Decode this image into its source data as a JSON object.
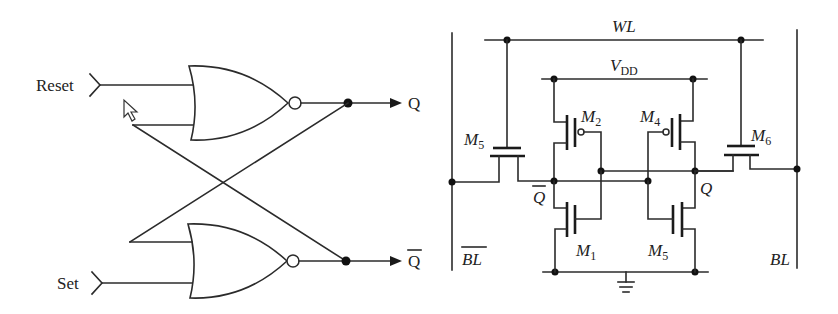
{
  "sr_latch": {
    "inputs": {
      "reset_label": "Reset",
      "set_label": "Set"
    },
    "outputs": {
      "q_label": "Q",
      "q_bar_label": "Q"
    },
    "gates": [
      {
        "type": "NOR",
        "position": "upper",
        "inputs": [
          "Reset",
          "Q-bar feedback"
        ],
        "output": "Q"
      },
      {
        "type": "NOR",
        "position": "lower",
        "inputs": [
          "Q feedback",
          "Set"
        ],
        "output": "Q-bar"
      }
    ],
    "cursor": "mouse-pointer-icon"
  },
  "sram_cell": {
    "word_line": {
      "label": "WL"
    },
    "supply": {
      "label": "V",
      "subscript": "DD"
    },
    "bit_line": {
      "label": "BL"
    },
    "bit_line_bar": {
      "label": "BL"
    },
    "nodes": {
      "q": "Q",
      "q_bar": "Q"
    },
    "transistors": [
      {
        "name": "M",
        "subscript": "5",
        "role": "access",
        "side": "left"
      },
      {
        "name": "M",
        "subscript": "2",
        "role": "pull-up PMOS",
        "side": "left"
      },
      {
        "name": "M",
        "subscript": "4",
        "role": "pull-up PMOS",
        "side": "right"
      },
      {
        "name": "M",
        "subscript": "6",
        "role": "access",
        "side": "right"
      },
      {
        "name": "M",
        "subscript": "1",
        "role": "pull-down NMOS",
        "side": "left"
      },
      {
        "name": "M",
        "subscript": "5",
        "role": "pull-down NMOS",
        "side": "right"
      }
    ],
    "ground": "ground-icon"
  }
}
